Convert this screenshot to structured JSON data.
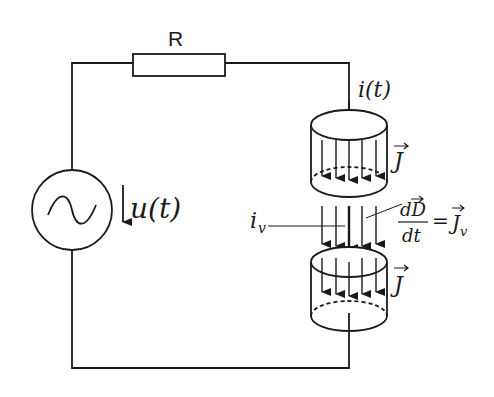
{
  "diagram": {
    "labels": {
      "resistor": "R",
      "source_voltage": "u(t)",
      "current": "i(t)",
      "current_density_top": "J",
      "current_density_bottom": "J",
      "displacement_current": "i",
      "displacement_current_sub": "v",
      "dD": "dD",
      "dt": "dt",
      "equals": "=",
      "Jv": "J",
      "Jv_sub": "v"
    },
    "colors": {
      "stroke": "#1a1a1a",
      "background": "#ffffff"
    }
  }
}
